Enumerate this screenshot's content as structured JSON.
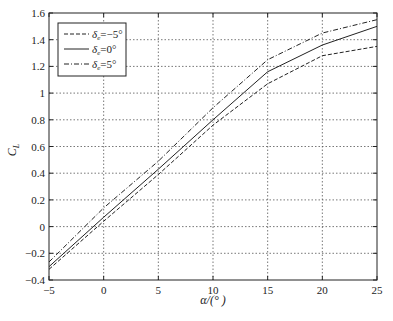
{
  "chart_data": {
    "type": "line",
    "title": "",
    "xlabel": "α/(° )",
    "ylabel": "C_L",
    "xlim": [
      -5,
      25
    ],
    "ylim": [
      -0.4,
      1.6
    ],
    "xticks": [
      -5,
      0,
      5,
      10,
      15,
      20,
      25
    ],
    "xtick_labels": [
      "−5",
      "0",
      "5",
      "10",
      "15",
      "20",
      "25"
    ],
    "yticks": [
      -0.4,
      -0.2,
      0,
      0.2,
      0.4,
      0.6,
      0.8,
      1,
      1.2,
      1.4,
      1.6
    ],
    "ytick_labels": [
      "−0.4",
      "−0.2",
      "0",
      "0.2",
      "0.4",
      "0.6",
      "0.8",
      "1",
      "1.2",
      "1.4",
      "1.6"
    ],
    "grid": true,
    "legend_position": "upper left",
    "x": [
      -5,
      0,
      5,
      10,
      15,
      20,
      25
    ],
    "series": [
      {
        "name": "δe=−5°",
        "label_main": "δ",
        "label_sub": "e",
        "label_rest": "=−5°",
        "style": "dashed",
        "values": [
          -0.32,
          0.04,
          0.39,
          0.76,
          1.07,
          1.28,
          1.35
        ]
      },
      {
        "name": "δe=0°",
        "label_main": "δ",
        "label_sub": "e",
        "label_rest": "=0°",
        "style": "solid",
        "values": [
          -0.3,
          0.07,
          0.43,
          0.8,
          1.16,
          1.36,
          1.5
        ]
      },
      {
        "name": "δe=5°",
        "label_main": "δ",
        "label_sub": "e",
        "label_rest": "=5°",
        "style": "dashdot",
        "values": [
          -0.265,
          0.14,
          0.49,
          0.89,
          1.25,
          1.45,
          1.55
        ]
      }
    ]
  },
  "axis": {
    "ylabel_main": "C",
    "ylabel_sub": "L",
    "xlabel": "α/(° )"
  }
}
